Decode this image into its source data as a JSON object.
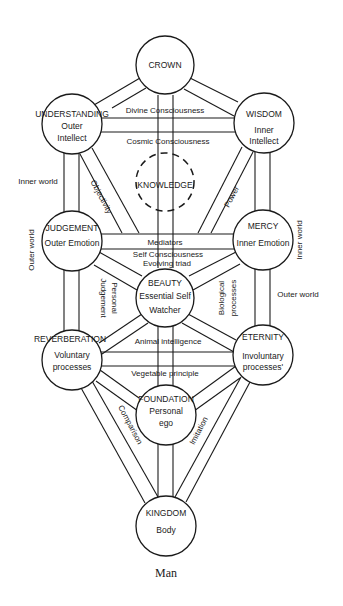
{
  "diagram": {
    "caption": "Man",
    "colors": {
      "ink": "#1a1a1a",
      "background": "#ffffff"
    },
    "nodes": {
      "crown": {
        "title": "CROWN"
      },
      "understanding": {
        "title": "UNDERSTANDING",
        "line1": "Outer",
        "line2": "Intellect"
      },
      "wisdom": {
        "title": "WISDOM",
        "line1": "Inner",
        "line2": "Intellect"
      },
      "knowledge": {
        "title": "KNOWLEDGE"
      },
      "judgement": {
        "title": "JUDGEMENT",
        "line1": "Outer Emotion"
      },
      "mercy": {
        "title": "MERCY",
        "line1": "Inner Emotion"
      },
      "beauty": {
        "title": "BEAUTY",
        "line1": "Essential Self",
        "line2": "Watcher"
      },
      "reverberation": {
        "title": "REVERBERATION",
        "line1": "Voluntary",
        "line2": "processes"
      },
      "eternity": {
        "title": "ETERNITY",
        "line1": "Involuntary",
        "line2": "processes'"
      },
      "foundation": {
        "title": "FOUNDATION",
        "line1": "Personal",
        "line2": "ego"
      },
      "kingdom": {
        "title": "KINGDOM",
        "line1": "Body"
      }
    },
    "path_labels": {
      "divine": "Divine Consciousness",
      "cosmic": "Cosmic Consciousness",
      "inner_world_left": "Inner world",
      "outer_world_left": "Outer world",
      "inner_world_right": "Inner world",
      "outer_world_right": "Outer world",
      "objectivity": "Objectivity",
      "power": "Power",
      "mediators": "Mediators",
      "self_consciousness": "Self Consciousness",
      "evolving_triad": "Evolving triad",
      "personal_judgement_1": "Personal",
      "personal_judgement_2": "Judgement",
      "biological_1": "Biological",
      "biological_2": "processes",
      "animal": "Animal intelligence",
      "vegetable": "Vegetable principle",
      "comparison": "Comparison",
      "imitation": "Imitation"
    }
  }
}
